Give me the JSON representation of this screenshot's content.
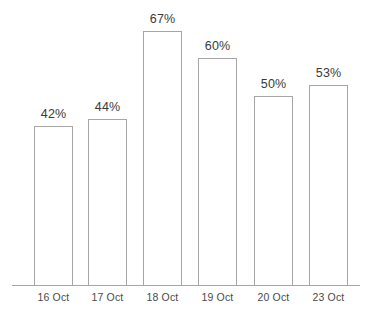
{
  "chart_data": {
    "type": "bar",
    "title": "",
    "subtitle": "",
    "xlabel": "",
    "ylabel": "",
    "categories": [
      "16 Oct",
      "17 Oct",
      "18 Oct",
      "19 Oct",
      "20 Oct",
      "23 Oct"
    ],
    "values": [
      42,
      44,
      67,
      60,
      50,
      53
    ],
    "value_labels": [
      "42%",
      "44%",
      "67%",
      "60%",
      "50%",
      "53%"
    ],
    "unit": "%",
    "ylim": [
      0,
      75
    ],
    "grid": false,
    "legend": false,
    "legend_position": "none",
    "y_axis_visible": false,
    "x_axis_visible": true,
    "bar_fill": "#ffffff",
    "bar_stroke": "#a6a6a6",
    "axis_color": "#a6a6a6",
    "label_color": "#3a3a3a",
    "background": "#ffffff",
    "points": [
      {
        "category": "16 Oct",
        "value": 42,
        "label": "42%"
      },
      {
        "category": "17 Oct",
        "value": 44,
        "label": "44%"
      },
      {
        "category": "18 Oct",
        "value": 67,
        "label": "67%"
      },
      {
        "category": "19 Oct",
        "value": 60,
        "label": "60%"
      },
      {
        "category": "20 Oct",
        "value": 50,
        "label": "50%"
      },
      {
        "category": "23 Oct",
        "value": 53,
        "label": "53%"
      }
    ]
  },
  "layout": {
    "baseline_y": 286,
    "axis_left": 12,
    "axis_right": 360,
    "bar_width": 39,
    "px_per_unit": 3.8,
    "bar_left_positions": [
      34,
      88,
      143,
      198,
      254,
      309
    ]
  }
}
